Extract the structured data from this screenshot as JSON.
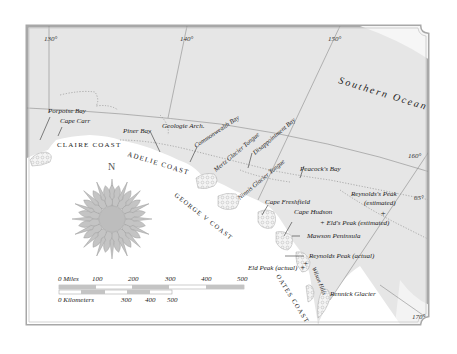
{
  "map": {
    "ocean_label": "Southern Ocean",
    "colors": {
      "sea": "#e4e4e4",
      "land": "#ffffff",
      "frame": "#a8a8a8",
      "grid": "#8c8c8c",
      "ice": "#cfcfcf",
      "text": "#222222"
    },
    "longitudes": [
      {
        "label": "130°"
      },
      {
        "label": "140°"
      },
      {
        "label": "150°"
      },
      {
        "label": "160°"
      },
      {
        "label": "170°"
      }
    ],
    "latitudes": [
      {
        "label": "65°"
      }
    ],
    "coasts": [
      {
        "label": "CLAIRE COAST"
      },
      {
        "label": "ADELIE COAST"
      },
      {
        "label": "GEORGE V COAST"
      },
      {
        "label": "OATES COAST"
      }
    ],
    "places": [
      {
        "label": "Porpoise Bay"
      },
      {
        "label": "Cape Carr"
      },
      {
        "label": "Piner Bay"
      },
      {
        "label": "Geologie Arch."
      },
      {
        "label": "Commonwealth Bay"
      },
      {
        "label": "Mertz Glacier Tongue"
      },
      {
        "label": "Disappointment Bay"
      },
      {
        "label": "Ninnis Glacier Tongue"
      },
      {
        "label": "Peacock's Bay"
      },
      {
        "label": "Cape Freshfield"
      },
      {
        "label": "Cape Hudson"
      },
      {
        "label": "Mawson Peninsula"
      },
      {
        "label": "Reynolds Peak (actual)"
      },
      {
        "label": "Eld Peak (actual)"
      },
      {
        "label": "Wilson Hills"
      },
      {
        "label": "Rennick Glacier"
      }
    ],
    "peaks_estimated": [
      {
        "label": "Reynolds's Peak",
        "sub": "(estimated)"
      },
      {
        "label": "+ Eld's Peak (estimated)"
      }
    ],
    "compass": {
      "label": "N"
    },
    "scale": {
      "miles_label": "0  Miles",
      "miles_ticks": [
        "100",
        "200",
        "300",
        "400",
        "500"
      ],
      "km_label": "0  Kilometers",
      "km_ticks": [
        "300",
        "400",
        "500"
      ]
    }
  }
}
